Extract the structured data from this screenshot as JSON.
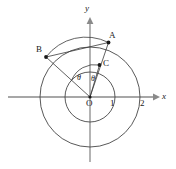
{
  "figure": {
    "background_color": "#ffffff",
    "curve_color": "#3f3f3f",
    "axis_color": "#808080",
    "label_color": "#1a1a1a"
  },
  "axes": {
    "x_label": "x",
    "y_label": "y",
    "origin_label": "O",
    "x_ticks": [
      {
        "label": "1",
        "value": 1
      },
      {
        "label": "2",
        "value": 2
      }
    ]
  },
  "points": {
    "A": {
      "label": "A",
      "x": 0.72,
      "y": 1.86
    },
    "B": {
      "label": "B",
      "x": -1.77,
      "y": 0.93
    },
    "C": {
      "label": "C",
      "x": 0.36,
      "y": 0.93
    },
    "O": {
      "label": "O",
      "x": 0,
      "y": 0
    }
  },
  "angles": [
    {
      "label": "θ",
      "name": "theta-left"
    },
    {
      "label": "θ",
      "name": "theta-right"
    }
  ],
  "circles": [
    {
      "name": "inner-circle",
      "radius": 1
    },
    {
      "name": "outer-circle",
      "radius": 2
    }
  ],
  "segments": [
    {
      "name": "segment-OA",
      "from": "O",
      "to": "A"
    },
    {
      "name": "segment-OB",
      "from": "O",
      "to": "B"
    },
    {
      "name": "segment-OC",
      "from": "O",
      "to": "C"
    },
    {
      "name": "segment-AB",
      "from": "A",
      "to": "B"
    }
  ],
  "arcs": [
    {
      "name": "arc-BA",
      "from": "B",
      "to": "A"
    },
    {
      "name": "arc-angle-marker",
      "from": "OB",
      "to": "OC"
    }
  ]
}
